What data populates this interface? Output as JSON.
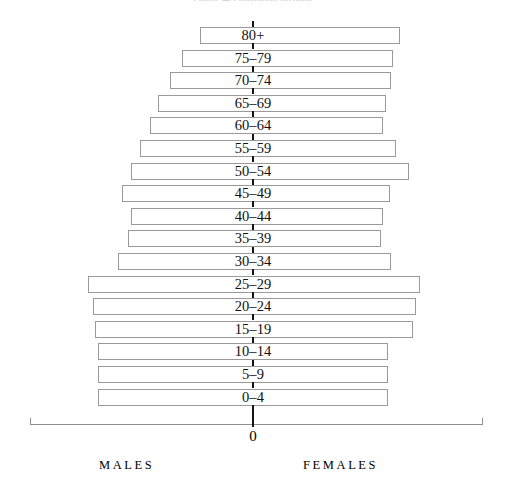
{
  "header": {
    "clipped_text": "Figure — Population pyramid"
  },
  "axis": {
    "zero_label": "0",
    "males_label": "MALES",
    "females_label": "FEMALES"
  },
  "colors": {
    "bar_fill": "#ffffff",
    "bar_border": "#9a9a9a",
    "axis": "#8f8f8f",
    "center_line": "#141414",
    "text": "#000000"
  },
  "chart_data": {
    "type": "bar",
    "title": "Population pyramid",
    "subtype": "population-pyramid",
    "orientation": "horizontal",
    "xlabel": "",
    "ylabel": "",
    "grid": false,
    "legend_position": "below-axis",
    "axis_center_value": 0,
    "axis_range_px": [
      30,
      483
    ],
    "center_px": 253,
    "note": "Each age band is drawn as one continuous outlined box spanning both the male (left) and female (right) side of the zero axis. Widths are read off the drawing in pixels and converted to approximate population share per side.",
    "categories": [
      "80+",
      "75–79",
      "70–74",
      "65–69",
      "60–64",
      "55–59",
      "50–54",
      "45–49",
      "40–44",
      "35–39",
      "30–34",
      "25–29",
      "20–24",
      "15–19",
      "10–14",
      "5–9",
      "0–4"
    ],
    "series": [
      {
        "name": "MALES",
        "side": "left",
        "values": [
          53,
          71,
          83,
          95,
          103,
          113,
          122,
          131,
          122,
          125,
          135,
          165,
          160,
          158,
          155,
          155,
          155
        ]
      },
      {
        "name": "FEMALES",
        "side": "right",
        "values": [
          147,
          140,
          138,
          133,
          130,
          143,
          156,
          137,
          130,
          128,
          138,
          167,
          163,
          160,
          135,
          135,
          135
        ]
      }
    ],
    "bars_px": [
      {
        "label": "80+",
        "left": 200,
        "right": 400
      },
      {
        "label": "75–79",
        "left": 182,
        "right": 393
      },
      {
        "label": "70–74",
        "left": 170,
        "right": 391
      },
      {
        "label": "65–69",
        "left": 158,
        "right": 386
      },
      {
        "label": "60–64",
        "left": 150,
        "right": 383
      },
      {
        "label": "55–59",
        "left": 140,
        "right": 396
      },
      {
        "label": "50–54",
        "left": 131,
        "right": 409
      },
      {
        "label": "45–49",
        "left": 122,
        "right": 390
      },
      {
        "label": "40–44",
        "left": 131,
        "right": 383
      },
      {
        "label": "35–39",
        "left": 128,
        "right": 381
      },
      {
        "label": "30–34",
        "left": 118,
        "right": 391
      },
      {
        "label": "25–29",
        "left": 88,
        "right": 420
      },
      {
        "label": "20–24",
        "left": 93,
        "right": 416
      },
      {
        "label": "15–19",
        "left": 95,
        "right": 413
      },
      {
        "label": "10–14",
        "left": 98,
        "right": 388
      },
      {
        "label": "5–9",
        "left": 98,
        "right": 388
      },
      {
        "label": "0–4",
        "left": 98,
        "right": 388
      }
    ]
  }
}
